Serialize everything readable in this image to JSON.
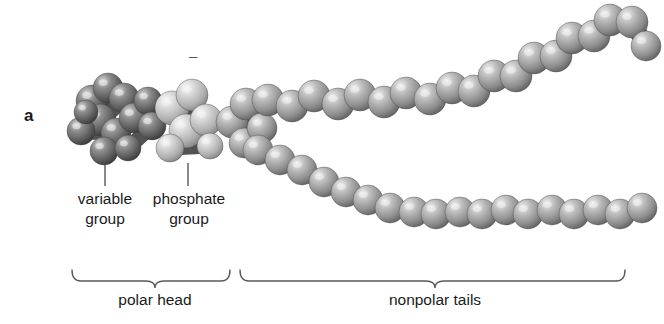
{
  "figure": {
    "panel_letter": "a",
    "charge_symbol": "–",
    "background_color": "#ffffff"
  },
  "callouts": [
    {
      "name": "variable-group",
      "text": "variable\ngroup",
      "leader_x": 105
    },
    {
      "name": "phosphate-group",
      "text": "phosphate\ngroup",
      "leader_x": 188
    }
  ],
  "brackets": [
    {
      "name": "polar-head",
      "label": "polar head",
      "x_start": 72,
      "x_end": 230,
      "tick_x": 155
    },
    {
      "name": "nonpolar-tails",
      "label": "nonpolar tails",
      "x_start": 240,
      "x_end": 625,
      "tick_x": 435
    }
  ],
  "molecule": {
    "description": "phospholipid space-filling model",
    "colors": {
      "variable_group_sphere": "#6e6e6e",
      "phosphate_group_sphere": "#bdbdbd",
      "tail_sphere": "#9a9a9a",
      "bond_shadow": "#4a4a4a",
      "highlight": "#f2f2f2",
      "outline": "#3d3d3d",
      "leader_line": "#4a4a4a",
      "bracket_line": "#5a5a5a"
    },
    "groups": [
      {
        "name": "variable-group",
        "tone": "dark",
        "spheres": [
          {
            "cx": 92,
            "cy": 101,
            "r": 16
          },
          {
            "cx": 108,
            "cy": 88,
            "r": 15
          },
          {
            "cx": 124,
            "cy": 98,
            "r": 15
          },
          {
            "cx": 100,
            "cy": 120,
            "r": 16
          },
          {
            "cx": 81,
            "cy": 131,
            "r": 14
          },
          {
            "cx": 116,
            "cy": 133,
            "r": 15
          },
          {
            "cx": 104,
            "cy": 151,
            "r": 14
          },
          {
            "cx": 134,
            "cy": 118,
            "r": 15
          },
          {
            "cx": 148,
            "cy": 101,
            "r": 14
          },
          {
            "cx": 152,
            "cy": 126,
            "r": 14
          },
          {
            "cx": 128,
            "cy": 148,
            "r": 13
          },
          {
            "cx": 86,
            "cy": 112,
            "r": 12
          }
        ]
      },
      {
        "name": "phosphate-group",
        "tone": "light",
        "spheres": [
          {
            "cx": 172,
            "cy": 108,
            "r": 17
          },
          {
            "cx": 192,
            "cy": 95,
            "r": 16
          },
          {
            "cx": 186,
            "cy": 131,
            "r": 17
          },
          {
            "cx": 206,
            "cy": 120,
            "r": 16
          },
          {
            "cx": 170,
            "cy": 148,
            "r": 14
          },
          {
            "cx": 210,
            "cy": 146,
            "r": 13
          }
        ]
      },
      {
        "name": "glycerol-link",
        "tone": "mid",
        "spheres": [
          {
            "cx": 232,
            "cy": 122,
            "r": 16
          },
          {
            "cx": 246,
            "cy": 104,
            "r": 16
          },
          {
            "cx": 244,
            "cy": 143,
            "r": 15
          },
          {
            "cx": 262,
            "cy": 128,
            "r": 15
          }
        ]
      },
      {
        "name": "upper-tail",
        "tone": "mid",
        "spheres": [
          {
            "cx": 268,
            "cy": 100,
            "r": 16
          },
          {
            "cx": 292,
            "cy": 106,
            "r": 16
          },
          {
            "cx": 314,
            "cy": 96,
            "r": 16
          },
          {
            "cx": 338,
            "cy": 104,
            "r": 16
          },
          {
            "cx": 360,
            "cy": 95,
            "r": 16
          },
          {
            "cx": 384,
            "cy": 102,
            "r": 16
          },
          {
            "cx": 406,
            "cy": 93,
            "r": 16
          },
          {
            "cx": 430,
            "cy": 99,
            "r": 16
          },
          {
            "cx": 452,
            "cy": 88,
            "r": 16
          },
          {
            "cx": 474,
            "cy": 91,
            "r": 16
          },
          {
            "cx": 494,
            "cy": 76,
            "r": 16
          },
          {
            "cx": 516,
            "cy": 76,
            "r": 16
          },
          {
            "cx": 534,
            "cy": 58,
            "r": 16
          },
          {
            "cx": 556,
            "cy": 56,
            "r": 16
          },
          {
            "cx": 572,
            "cy": 38,
            "r": 16
          },
          {
            "cx": 594,
            "cy": 36,
            "r": 16
          },
          {
            "cx": 610,
            "cy": 20,
            "r": 16
          },
          {
            "cx": 632,
            "cy": 22,
            "r": 16
          },
          {
            "cx": 646,
            "cy": 46,
            "r": 15
          }
        ]
      },
      {
        "name": "lower-tail",
        "tone": "mid",
        "spheres": [
          {
            "cx": 258,
            "cy": 150,
            "r": 15
          },
          {
            "cx": 280,
            "cy": 160,
            "r": 15
          },
          {
            "cx": 302,
            "cy": 170,
            "r": 15
          },
          {
            "cx": 324,
            "cy": 182,
            "r": 15
          },
          {
            "cx": 346,
            "cy": 192,
            "r": 15
          },
          {
            "cx": 368,
            "cy": 200,
            "r": 15
          },
          {
            "cx": 390,
            "cy": 208,
            "r": 15
          },
          {
            "cx": 414,
            "cy": 212,
            "r": 15
          },
          {
            "cx": 436,
            "cy": 214,
            "r": 15
          },
          {
            "cx": 460,
            "cy": 212,
            "r": 15
          },
          {
            "cx": 482,
            "cy": 214,
            "r": 15
          },
          {
            "cx": 506,
            "cy": 210,
            "r": 15
          },
          {
            "cx": 528,
            "cy": 214,
            "r": 15
          },
          {
            "cx": 552,
            "cy": 210,
            "r": 15
          },
          {
            "cx": 574,
            "cy": 214,
            "r": 15
          },
          {
            "cx": 598,
            "cy": 210,
            "r": 15
          },
          {
            "cx": 620,
            "cy": 214,
            "r": 15
          },
          {
            "cx": 642,
            "cy": 208,
            "r": 15
          }
        ]
      }
    ]
  }
}
